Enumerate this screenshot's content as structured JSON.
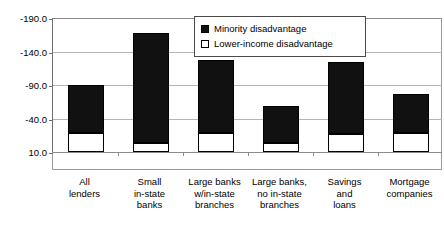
{
  "chart_data": {
    "type": "bar",
    "subtype": "stacked-vertical",
    "title": "",
    "subtitle": "",
    "xlabel": "",
    "ylabel": "",
    "grid": true,
    "legend_position": "top-center-inside",
    "y_axis_inverted": true,
    "ylim": [
      -190.0,
      10.0
    ],
    "y_ticks": [
      "-190.0",
      "-140.0",
      "-90.0",
      "-40.0",
      "10.0"
    ],
    "y_tick_values": [
      -190.0,
      -140.0,
      -90.0,
      -40.0,
      10.0
    ],
    "categories": [
      "All lenders",
      "Small in-state banks",
      "Large banks w/in-state branches",
      "Large banks, no in-state branches",
      "Savings and loans",
      "Mortgage companies"
    ],
    "category_lines": [
      [
        "All",
        "lenders"
      ],
      [
        "Small",
        "in-state",
        "banks"
      ],
      [
        "Large banks",
        "w/in-state",
        "branches"
      ],
      [
        "Large banks,",
        "no in-state",
        "branches"
      ],
      [
        "Savings",
        "and",
        "loans"
      ],
      [
        "Mortgage",
        "companies"
      ]
    ],
    "series": [
      {
        "name": "Minority disadvantage",
        "color": "#111111",
        "style": "solid-fill",
        "values": [
          -90,
          -168,
          -128,
          -58,
          -125,
          -77
        ]
      },
      {
        "name": "Lower-income disadvantage",
        "color": "#ffffff",
        "style": "hollow-outline",
        "values": [
          -18,
          -3,
          -18,
          -3,
          -17,
          -18
        ]
      }
    ]
  },
  "legend": {
    "items": [
      {
        "label": "Minority disadvantage",
        "swatch": "filled-square-icon"
      },
      {
        "label": "Lower-income disadvantage",
        "swatch": "hollow-square-icon"
      }
    ]
  },
  "colors": {
    "minority": "#111111",
    "lower_income": "#ffffff",
    "outline": "#000000",
    "grid": "#b4b4b4",
    "frame": "#9a9a9a",
    "background": "#ffffff"
  }
}
